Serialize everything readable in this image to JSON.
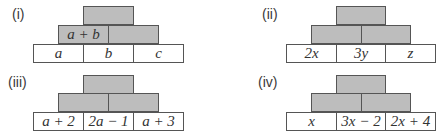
{
  "pyramids": [
    {
      "label": "(i)",
      "bottom": [
        "a",
        "b",
        "c"
      ],
      "middle": [
        "a + b",
        ""
      ],
      "top": [
        ""
      ]
    },
    {
      "label": "(ii)",
      "bottom": [
        "2x",
        "3y",
        "z"
      ],
      "middle": [
        "",
        ""
      ],
      "top": [
        ""
      ]
    },
    {
      "label": "(iii)",
      "bottom": [
        "a + 2",
        "2a − 1",
        "a + 3"
      ],
      "middle": [
        "",
        ""
      ],
      "top": [
        ""
      ]
    },
    {
      "label": "(iv)",
      "bottom": [
        "x",
        "3x − 2",
        "2x + 4"
      ],
      "middle": [
        "",
        ""
      ],
      "top": [
        ""
      ]
    }
  ],
  "colors": {
    "shaded": "#bdbdbd",
    "border": "#555555",
    "bottom": "#ffffff"
  }
}
